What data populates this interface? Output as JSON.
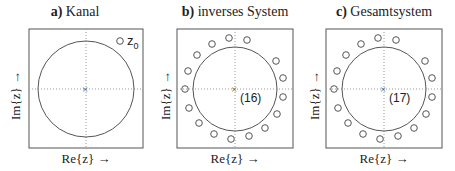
{
  "panels": [
    {
      "letter": "a)",
      "title": "Kanal",
      "xlabel": "Re{z}  →",
      "ylabel": "Im{z}  →",
      "zero_label": "z",
      "zero_sub": "0",
      "pole_label": ""
    },
    {
      "letter": "b)",
      "title": "inverses System",
      "xlabel": "Re{z}  →",
      "ylabel": "Im{z}  →",
      "pole_label": "(16)"
    },
    {
      "letter": "c)",
      "title": "Gesamtsystem",
      "xlabel": "Re{z}  →",
      "ylabel": "Im{z}  →",
      "pole_label": "(17)"
    }
  ]
}
